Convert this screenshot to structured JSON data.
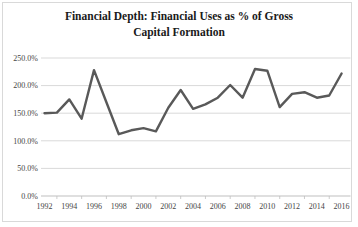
{
  "chart": {
    "title_line1": "Financial Depth: Financial Uses as % of Gross",
    "title_line2": "Capital Formation"
  },
  "chart_data": {
    "type": "line",
    "title": "Financial Depth: Financial Uses as % of Gross Capital Formation",
    "xlabel": "",
    "ylabel": "",
    "unit": "%",
    "x": [
      1992,
      1993,
      1994,
      1995,
      1996,
      1997,
      1998,
      1999,
      2000,
      2001,
      2002,
      2003,
      2004,
      2005,
      2006,
      2007,
      2008,
      2009,
      2010,
      2011,
      2012,
      2013,
      2014,
      2015,
      2016
    ],
    "values": [
      150,
      151,
      175,
      140,
      228,
      170,
      112,
      119,
      123,
      117,
      160,
      192,
      158,
      166,
      178,
      201,
      178,
      230,
      227,
      161,
      185,
      188,
      178,
      182,
      222
    ],
    "ylim": [
      0,
      250
    ],
    "y_step": 50,
    "y_tick_labels": [
      "250.0%",
      "200.0%",
      "150.0%",
      "100.0%",
      "50.0%",
      "0.0%"
    ],
    "x_tick_labels": [
      "1992",
      "1994",
      "1996",
      "1998",
      "2000",
      "2002",
      "2004",
      "2006",
      "2008",
      "2010",
      "2012",
      "2014",
      "2016"
    ],
    "grid": "horizontal",
    "legend": "none",
    "markers": "none",
    "colors": {
      "line": "#595959",
      "grid": "#D9D9D9",
      "axis": "#BFBFBF",
      "labels": "#454545",
      "title": "#1A1A1A",
      "border": "#D9D9D9",
      "background": "#FFFFFF"
    }
  }
}
